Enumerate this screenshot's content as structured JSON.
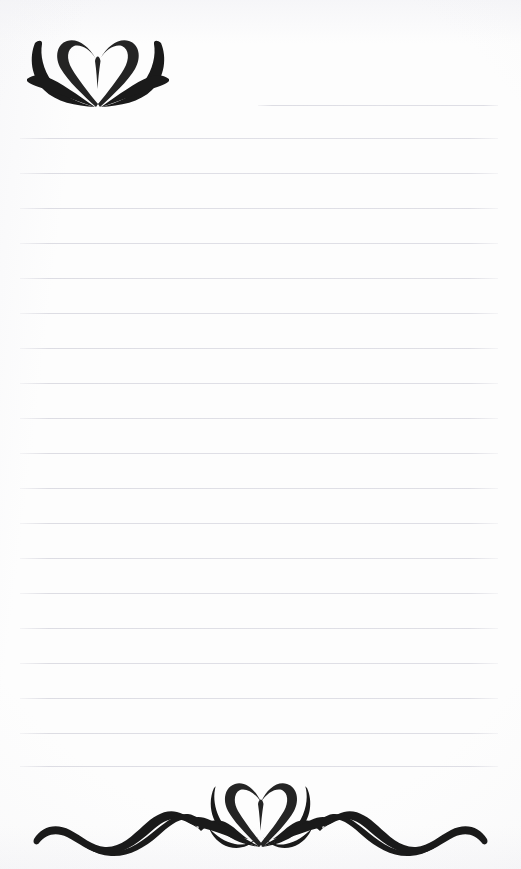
{
  "document": {
    "kind": "lined-stationery-page",
    "title": "Decorative Lined Notepaper",
    "page_width": 521,
    "page_height": 869,
    "background_color": "#fdfdfd",
    "ink_color": "#1a1a1a",
    "rule_color": "#dcdce3",
    "text_content": "",
    "writing_area_placeholder": ""
  },
  "header": {
    "ornament_name": "lotus-heart-flourish",
    "ornament_position": "top-left",
    "ornament_label": "Lotus heart ornament",
    "x": 26,
    "y": 33,
    "width": 144,
    "height": 80
  },
  "footer": {
    "ornament_name": "lotus-heart-wave-flourish",
    "ornament_position": "bottom-center",
    "ornament_label": "Lotus heart ornament with wave tendrils",
    "x": 8,
    "y": 776,
    "width": 505,
    "height": 86
  },
  "rules": {
    "count": 19,
    "spacing": 35,
    "left": 20,
    "right": 498,
    "first_line_indent": 258,
    "lines": [
      {
        "index": 1,
        "y": 105,
        "left": 258,
        "right": 498,
        "short": true
      },
      {
        "index": 2,
        "y": 138,
        "left": 20,
        "right": 498,
        "short": false
      },
      {
        "index": 3,
        "y": 173,
        "left": 20,
        "right": 498,
        "short": false
      },
      {
        "index": 4,
        "y": 208,
        "left": 20,
        "right": 498,
        "short": false
      },
      {
        "index": 5,
        "y": 243,
        "left": 20,
        "right": 498,
        "short": false
      },
      {
        "index": 6,
        "y": 278,
        "left": 20,
        "right": 498,
        "short": false
      },
      {
        "index": 7,
        "y": 313,
        "left": 20,
        "right": 498,
        "short": false
      },
      {
        "index": 8,
        "y": 348,
        "left": 20,
        "right": 498,
        "short": false
      },
      {
        "index": 9,
        "y": 383,
        "left": 20,
        "right": 498,
        "short": false
      },
      {
        "index": 10,
        "y": 418,
        "left": 20,
        "right": 498,
        "short": false
      },
      {
        "index": 11,
        "y": 453,
        "left": 20,
        "right": 498,
        "short": false
      },
      {
        "index": 12,
        "y": 488,
        "left": 20,
        "right": 498,
        "short": false
      },
      {
        "index": 13,
        "y": 523,
        "left": 20,
        "right": 498,
        "short": false
      },
      {
        "index": 14,
        "y": 558,
        "left": 20,
        "right": 498,
        "short": false
      },
      {
        "index": 15,
        "y": 593,
        "left": 20,
        "right": 498,
        "short": false
      },
      {
        "index": 16,
        "y": 628,
        "left": 20,
        "right": 498,
        "short": false
      },
      {
        "index": 17,
        "y": 663,
        "left": 20,
        "right": 498,
        "short": false
      },
      {
        "index": 18,
        "y": 698,
        "left": 20,
        "right": 498,
        "short": false
      },
      {
        "index": 19,
        "y": 733,
        "left": 20,
        "right": 498,
        "short": false
      },
      {
        "index": 20,
        "y": 766,
        "left": 20,
        "right": 498,
        "short": false
      }
    ]
  }
}
